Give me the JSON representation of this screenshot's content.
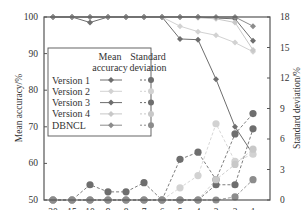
{
  "chart_data": {
    "type": "line",
    "title": "",
    "xlabel": "n_i^T",
    "ylabel": "Mean accuracy/%",
    "y2label": "Standard deviation/%",
    "categories": [
      "20",
      "15",
      "10",
      "9",
      "8",
      "7",
      "6",
      "5",
      "4",
      "3",
      "2",
      "1"
    ],
    "ylim": [
      50,
      100
    ],
    "y2lim": [
      0,
      18
    ],
    "yticks": [
      "50",
      "60",
      "70",
      "80",
      "90",
      "100"
    ],
    "y2ticks": [
      "0",
      "3",
      "6",
      "9",
      "12",
      "15",
      "18"
    ],
    "grid": false,
    "legend_position": "inside-left",
    "legend_headers": [
      "Mean accuracy",
      "Standard deviation"
    ],
    "series": [
      {
        "name": "Version 1",
        "color": "#6e6e6e",
        "mean_accuracy": [
          100,
          100,
          100,
          100,
          100,
          100,
          100,
          94,
          93.8,
          83,
          70,
          62.5
        ],
        "standard_deviation": [
          0,
          0,
          1.5,
          0.8,
          0.8,
          1.7,
          0,
          4,
          4.7,
          2,
          6.5,
          8.5
        ]
      },
      {
        "name": "Version 2",
        "color": "#d2d2d2",
        "mean_accuracy": [
          100,
          100,
          100,
          100,
          100,
          100,
          100,
          97.5,
          96,
          95,
          93,
          90.5
        ],
        "standard_deviation": [
          0,
          0,
          0,
          0,
          0,
          0,
          0,
          1.2,
          2.4,
          7.5,
          3.8,
          4.5
        ]
      },
      {
        "name": "Version 3",
        "color": "#6e6e6e",
        "mean_accuracy": [
          100,
          100,
          98.5,
          100,
          100,
          100,
          100,
          100,
          100,
          99.7,
          99.5,
          93.5
        ],
        "standard_deviation": [
          0,
          0,
          0,
          0,
          0,
          0,
          0,
          0,
          0,
          1.5,
          1.5,
          7
        ]
      },
      {
        "name": "Version 4",
        "color": "#c8c8c8",
        "mean_accuracy": [
          100,
          100,
          100,
          100,
          100,
          100,
          100,
          100,
          99.8,
          99.5,
          98.5,
          91
        ],
        "standard_deviation": [
          0,
          0,
          0,
          0,
          0,
          0,
          0,
          0,
          0,
          2,
          3.5,
          5
        ]
      },
      {
        "name": "DBNCL",
        "color": "#8c8c8c",
        "mean_accuracy": [
          100,
          100,
          100,
          100,
          100,
          100,
          100,
          100,
          100,
          100,
          100,
          97.5
        ],
        "standard_deviation": [
          0,
          0,
          0,
          0,
          0,
          0,
          0,
          0,
          0,
          0,
          0.3,
          2
        ]
      }
    ]
  },
  "legend": {
    "header_mean": [
      "Mean",
      "accuracy"
    ],
    "header_std": [
      "Standard",
      "deviation"
    ],
    "items": [
      "Version 1",
      "Version 2",
      "Version 3",
      "Version 4",
      "DBNCL"
    ]
  }
}
